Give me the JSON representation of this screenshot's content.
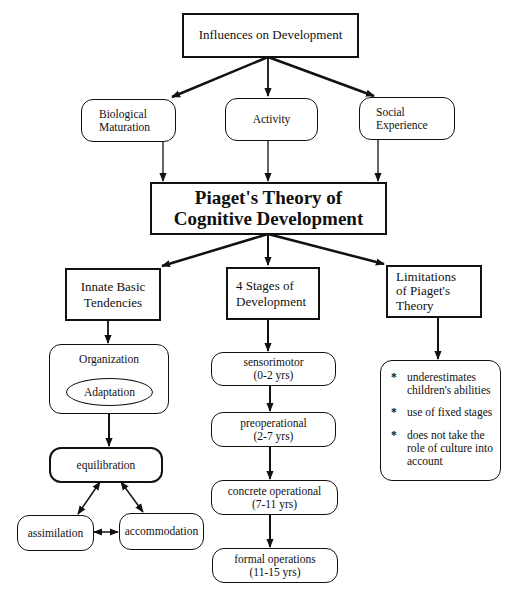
{
  "diagram": {
    "root": {
      "label": "Influences on Development"
    },
    "influences": [
      {
        "line1": "Biological",
        "line2": "Maturation"
      },
      {
        "line1": "Activity",
        "line2": ""
      },
      {
        "line1": "Social",
        "line2": "Experience"
      }
    ],
    "main": {
      "line1": "Piaget's Theory of",
      "line2": "Cognitive Development"
    },
    "branches": {
      "innate": {
        "line1": "Innate Basic",
        "line2": "Tendencies"
      },
      "stages": {
        "line1": "4 Stages of",
        "line2": "Development"
      },
      "limitations": {
        "line1": "Limitations",
        "line2": "of Piaget's",
        "line3": "Theory"
      }
    },
    "innate_details": {
      "organization": "Organization",
      "adaptation": "Adaptation",
      "equilibration": "equilibration",
      "assimilation": "assimilation",
      "accommodation": "accommodation"
    },
    "stages": [
      {
        "name": "sensorimotor",
        "ages": "(0-2 yrs)"
      },
      {
        "name": "preoperational",
        "ages": "(2-7 yrs)"
      },
      {
        "name": "concrete operational",
        "ages": "(7-11 yrs)"
      },
      {
        "name": "formal operations",
        "ages": "(11-15 yrs)"
      }
    ],
    "limitations_list": [
      "underestimates children's abilities",
      "use of fixed stages",
      "does not take the role of culture into account"
    ]
  }
}
